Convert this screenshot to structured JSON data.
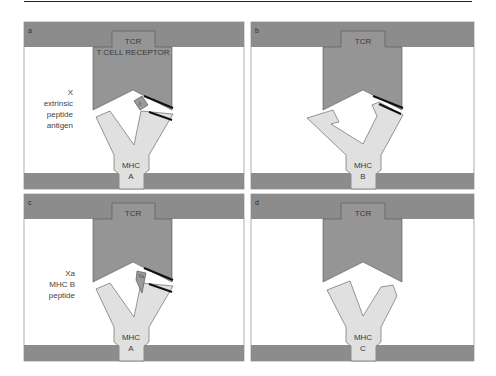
{
  "figure": {
    "colors": {
      "membrane": "#8c8c8c",
      "tcr": "#959595",
      "mhc": "#e0e0e0",
      "peptide": "#9a9a9a",
      "outline": "#555555",
      "contact": "#111111",
      "background": "#ffffff"
    },
    "panels": [
      {
        "id": "a",
        "tcr_label": "TCR",
        "tcr_sublabel": "T CELL RECEPTOR",
        "mhc_label": "MHC",
        "mhc_allele": "A",
        "peptide_label": "X",
        "side_text": [
          "X",
          "extrinsic",
          "peptide",
          "antigen"
        ]
      },
      {
        "id": "b",
        "tcr_label": "TCR",
        "mhc_label": "MHC",
        "mhc_allele": "B"
      },
      {
        "id": "c",
        "tcr_label": "TCR",
        "mhc_label": "MHC",
        "mhc_allele": "A",
        "peptide_label": "Xa",
        "side_text": [
          "Xa",
          "MHC B",
          "peptide"
        ]
      },
      {
        "id": "d",
        "tcr_label": "TCR",
        "mhc_label": "MHC",
        "mhc_allele": "C"
      }
    ]
  }
}
